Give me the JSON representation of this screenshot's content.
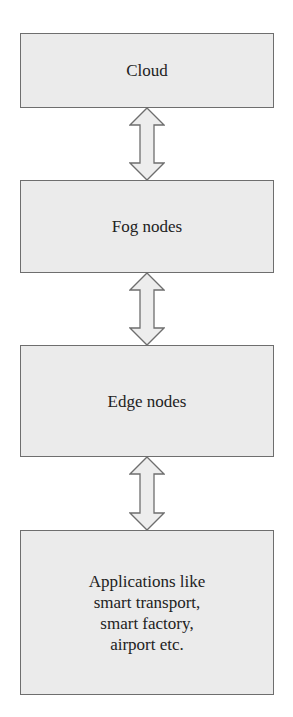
{
  "diagram": {
    "type": "layered-architecture",
    "nodes": [
      {
        "id": "cloud",
        "label": "Cloud"
      },
      {
        "id": "fog",
        "label": "Fog nodes"
      },
      {
        "id": "edge",
        "label": "Edge nodes"
      },
      {
        "id": "apps",
        "label": "Applications like\nsmart transport,\nsmart factory,\nairport etc."
      }
    ],
    "edges": [
      {
        "from": "cloud",
        "to": "fog",
        "style": "bidirectional-block-arrow"
      },
      {
        "from": "fog",
        "to": "edge",
        "style": "bidirectional-block-arrow"
      },
      {
        "from": "edge",
        "to": "apps",
        "style": "bidirectional-block-arrow"
      }
    ],
    "colors": {
      "box_fill": "#ebebeb",
      "box_border": "#6e6e6e",
      "arrow_fill": "#ededed",
      "arrow_stroke": "#6e6e6e"
    }
  }
}
